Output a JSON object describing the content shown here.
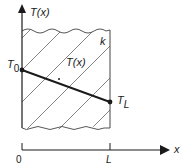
{
  "diagram": {
    "type": "1D steady conduction through a plane wall",
    "y_axis_label": "T(x)",
    "x_axis_label": "x",
    "origin_label": "0",
    "length_label": "L",
    "left_temperature_label": "T",
    "left_temperature_sub": "0",
    "right_temperature_label": "T",
    "right_temperature_sub": "L",
    "profile_label": "T(x)",
    "conductivity_label": "k",
    "colors": {
      "line": "#1a1a1a",
      "hatch": "#555555",
      "wall": "#444444"
    }
  }
}
